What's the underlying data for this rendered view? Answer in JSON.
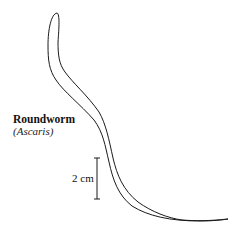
{
  "diagram": {
    "label": {
      "common_name": "Roundworm",
      "scientific_name": "(Ascaris)"
    },
    "scale_bar": {
      "text": "2 cm"
    },
    "colors": {
      "stroke": "#1a1a1a",
      "background": "#ffffff"
    }
  }
}
